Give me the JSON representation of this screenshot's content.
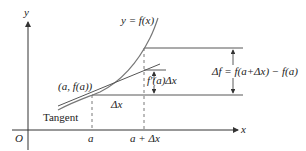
{
  "diagram": {
    "colors": {
      "axes": "#333333",
      "curve": "#777777",
      "tangent": "#555555",
      "guides": "#555555",
      "text": "#222222"
    },
    "labels": {
      "y_axis": "y",
      "x_axis": "x",
      "origin": "O",
      "curve": "y = f(x)",
      "point": "(a, f(a))",
      "tangent": "Tangent",
      "dx": "Δx",
      "fprime_dx": "f′(a)Δx",
      "delta_f": "Δf = f(a+Δx) − f(a)",
      "tick_a": "a",
      "tick_a_dx": "a + Δx"
    }
  }
}
